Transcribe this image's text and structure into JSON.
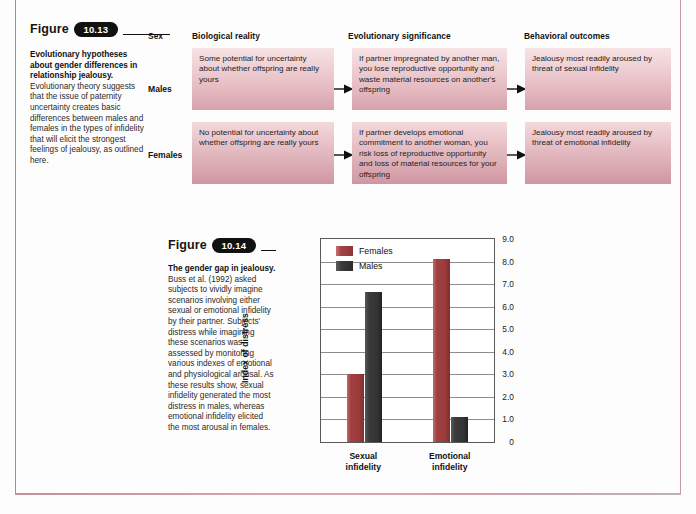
{
  "page": {
    "frame_color": "#b9848c"
  },
  "figure_1013": {
    "figure_word": "Figure",
    "number": "10.13",
    "caption_bold": "Evolutionary hypotheses about gender differences in relationship jealousy.",
    "caption_body": " Evolutionary theory suggests that the issue of paternity uncertainty creates basic differences between males and females in the types of infidelity that will elicit the strongest feelings of jealousy, as outlined here.",
    "columns": [
      {
        "header": "Sex"
      },
      {
        "header": "Biological reality"
      },
      {
        "header": "Evolutionary significance"
      },
      {
        "header": "Behavioral outcomes"
      }
    ],
    "rows": [
      {
        "sex": "Males",
        "biological_reality": "Some potential for uncertainty about whether offspring are really yours",
        "evolutionary_significance": "If partner impregnated by another man, you lose reproductive opportunity and waste material resources on another's offspring",
        "behavioral_outcome": "Jealousy most readily aroused by threat of sexual infidelity"
      },
      {
        "sex": "Females",
        "biological_reality": "No potential for uncertainty about whether offspring are really yours",
        "evolutionary_significance": "If partner develops emotional commitment to another woman, you risk loss of reproductive opportunity and loss of material resources for your offspring",
        "behavioral_outcome": "Jealousy most readily aroused by threat of emotional infidelity"
      }
    ]
  },
  "figure_1014": {
    "figure_word": "Figure",
    "number": "10.14",
    "caption_bold": "The gender gap in jealousy.",
    "caption_body": " Buss et al. (1992) asked subjects to vividly imagine scenarios involving either sexual or emotional infidelity by their partner. Subjects' distress while imagining these scenarios was assessed by monitoring various indexes of emotional and physiological arousal. As these results show, sexual infidelity generated the most distress in males, whereas emotional infidelity elicited the most arousal in females."
  },
  "chart_data": {
    "type": "bar",
    "title": "",
    "xlabel": "",
    "ylabel": "Index of distress",
    "categories": [
      "Sexual infidelity",
      "Emotional infidelity"
    ],
    "category_lines": [
      [
        "Sexual",
        "infidelity"
      ],
      [
        "Emotional",
        "infidelity"
      ]
    ],
    "series": [
      {
        "name": "Females",
        "values": [
          3.0,
          8.1
        ],
        "color": "#9b3b3b"
      },
      {
        "name": "Males",
        "values": [
          6.65,
          1.1
        ],
        "color": "#333333"
      }
    ],
    "ylim": [
      0,
      9
    ],
    "yticks": [
      9.0,
      8.0,
      7.0,
      6.0,
      5.0,
      4.0,
      3.0,
      2.0,
      1.0,
      0
    ],
    "ytick_labels": [
      "9.0",
      "8.0",
      "7.0",
      "6.0",
      "5.0",
      "4.0",
      "3.0",
      "2.0",
      "1.0",
      "0"
    ],
    "grid": true,
    "legend_position": "top-left"
  }
}
